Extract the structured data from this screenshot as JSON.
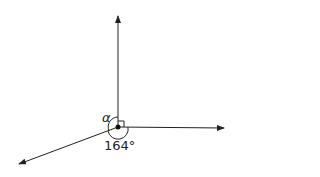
{
  "diagram": {
    "type": "angles-at-a-point",
    "labels": {
      "alpha": "α",
      "given_angle": "164°"
    },
    "right_angle_marker": true,
    "rays": [
      {
        "name": "up",
        "direction": "north"
      },
      {
        "name": "right",
        "direction": "east"
      },
      {
        "name": "lower-left",
        "direction": "south-west"
      }
    ],
    "colors": {
      "stroke": "#222222",
      "background": "#ffffff"
    }
  }
}
